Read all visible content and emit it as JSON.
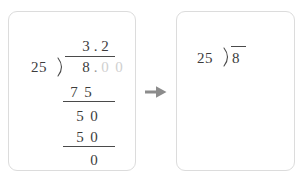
{
  "colors": {
    "card_background": "#ffffff",
    "card_border": "#dcdcdc",
    "digit": "#3c3c3c",
    "faded_digit": "#cfcfcf",
    "rule": "#4a4a4a",
    "arrow": "#8c8c8c",
    "page_background": "#ffffff"
  },
  "solved_card": {
    "quotient": {
      "digits": [
        "3",
        ".",
        "2"
      ],
      "whole": "3",
      "decimal_point": ".",
      "tenths": "2",
      "text": "3.2"
    },
    "divisor": "25",
    "bracket_icon": "division-bracket-icon",
    "dividend": {
      "text": "8.00",
      "whole": "8",
      "decimal_point": ".",
      "faded_digits": [
        "0",
        "0"
      ]
    },
    "steps": [
      {
        "label": "subtract-first",
        "digits": [
          "7",
          "5"
        ],
        "text": "7 5",
        "underlined": true
      },
      {
        "label": "bring-down",
        "digits": [
          "5",
          "0"
        ],
        "text": "5 0",
        "underlined": false
      },
      {
        "label": "subtract-second",
        "digits": [
          "5",
          "0"
        ],
        "text": "5 0",
        "underlined": true
      },
      {
        "label": "remainder",
        "digits": [
          "0"
        ],
        "text": "0",
        "underlined": false
      }
    ]
  },
  "arrow": {
    "icon": "arrow-right-icon",
    "direction": "right"
  },
  "problem_card": {
    "divisor": "25",
    "bracket_icon": "division-bracket-icon",
    "dividend": "8",
    "text": "25)8"
  }
}
